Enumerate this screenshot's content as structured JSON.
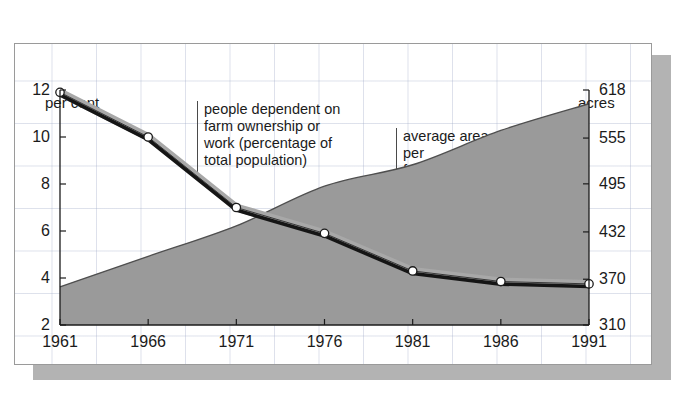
{
  "figure": {
    "left_axis_title": "per cent",
    "right_axis_title": "acres",
    "annotations": {
      "people": "people dependent on\nfarm ownership or\nwork (percentage of\ntotal population)",
      "area": "average area\nper\nfarm"
    }
  },
  "colors": {
    "area_fill": "#9a9a9a",
    "area_stroke": "#4f4f4f",
    "line_dark": "#151515",
    "line_band": "#a8a8a8",
    "marker_fill": "#ffffff",
    "marker_stroke": "#1b1b1b",
    "frame": "#9a9a9a",
    "grid": "#a0aac8",
    "shadow": "#b3b3b3",
    "text": "#1b1b1b"
  },
  "chart_data": {
    "type": "line",
    "title": "",
    "subtitle": "",
    "xlabel": "",
    "ylabel": "per cent",
    "y2label": "acres",
    "grid": true,
    "legend_position": "annotations-inline",
    "x": [
      "1961",
      "1966",
      "1971",
      "1976",
      "1981",
      "1986",
      "1991"
    ],
    "xtick_labels": [
      "1961",
      "1966",
      "1971",
      "1976",
      "1981",
      "1986",
      "1991"
    ],
    "ylim": [
      2,
      12
    ],
    "ytick_labels": [
      "12",
      "10",
      "8",
      "6",
      "4",
      "2"
    ],
    "yticks": [
      12,
      10,
      8,
      6,
      4,
      2
    ],
    "y2lim": [
      310,
      618
    ],
    "y2tick_labels": [
      "618",
      "555",
      "495",
      "432",
      "370",
      "310"
    ],
    "y2ticks": [
      618,
      555,
      495,
      432,
      370,
      310
    ],
    "series": [
      {
        "name": "people dependent on farm ownership or work (percentage of total population)",
        "axis": "left",
        "unit": "per cent",
        "render": "line-with-markers",
        "values": [
          11.9,
          10.0,
          7.0,
          5.9,
          4.3,
          3.85,
          3.75
        ]
      },
      {
        "name": "average area per farm",
        "axis": "right",
        "unit": "acres",
        "render": "filled-area",
        "values": [
          360,
          400,
          440,
          492,
          520,
          565,
          600
        ]
      }
    ]
  }
}
